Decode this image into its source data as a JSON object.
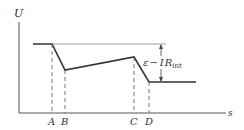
{
  "diagram": {
    "type": "voltage-vs-position plot",
    "axes": {
      "y_label": "U",
      "x_label": "s"
    },
    "points": [
      {
        "label": "A"
      },
      {
        "label": "B"
      },
      {
        "label": "C"
      },
      {
        "label": "D"
      }
    ],
    "annotation": {
      "emf": "ε",
      "minus": "−",
      "I": "I",
      "R": "R",
      "sub": "int"
    },
    "colors": {
      "stroke": "#333333",
      "reference": "#777777"
    }
  }
}
